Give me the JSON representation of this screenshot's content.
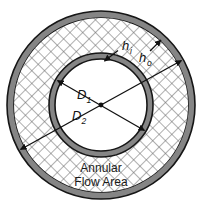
{
  "figure": {
    "name": "annular-flow-area-cross-section",
    "caption_line1": "Annular",
    "caption_line2": "Flow Area",
    "labels": {
      "h_inner_base": "h",
      "h_inner_sub": "i",
      "h_outer_base": "h",
      "h_outer_sub": "o",
      "d1_base": "D",
      "d1_sub": "1",
      "d2_base": "D",
      "d2_sub": "2"
    },
    "colors": {
      "wall_fill": "#858585",
      "wall_stroke": "#1a1a1a",
      "hatch_stroke": "#6b6b6b",
      "annulus_fill": "#ffffff",
      "core_fill": "#ffffff",
      "dimension_line": "#111111",
      "text": "#111111",
      "background": "#ffffff"
    },
    "geometry": {
      "center_x": 101,
      "center_y": 105,
      "outer_wall_outer_radius": 94,
      "outer_wall_inner_radius": 87,
      "inner_wall_outer_radius": 52,
      "inner_wall_inner_radius": 46
    }
  }
}
